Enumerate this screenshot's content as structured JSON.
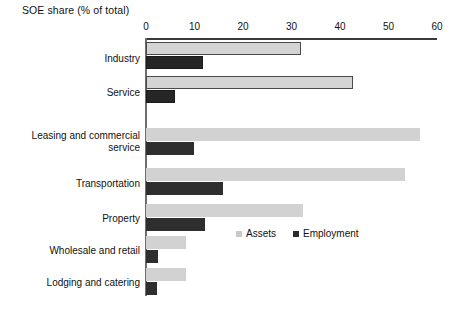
{
  "chart_data": {
    "type": "bar",
    "orientation": "horizontal",
    "title": "SOE share (% of total)",
    "xlabel": "",
    "ylabel": "",
    "xlim": [
      0,
      60
    ],
    "xticks": [
      0,
      10,
      20,
      30,
      40,
      50,
      60
    ],
    "grid": false,
    "legend_position": "inside-right-middle",
    "categories": [
      "Industry",
      "Service",
      "Leasing and commercial\nservice",
      "Transportation",
      "Property",
      "Wholesale and retail",
      "Lodging and catering"
    ],
    "series": [
      {
        "name": "Assets",
        "color": "#d2d2d2",
        "values": [
          32.0,
          42.7,
          56.5,
          53.4,
          32.4,
          8.2,
          8.2
        ]
      },
      {
        "name": "Employment",
        "color": "#2e2e2e",
        "values": [
          11.7,
          6.0,
          9.9,
          15.9,
          12.2,
          2.5,
          2.2
        ]
      }
    ]
  },
  "legend": {
    "items": [
      {
        "label": "Assets",
        "swatch": "assets"
      },
      {
        "label": "Employment",
        "swatch": "employment"
      }
    ]
  },
  "axis": {
    "tick_labels": [
      "0",
      "10",
      "20",
      "30",
      "40",
      "50",
      "60"
    ]
  }
}
